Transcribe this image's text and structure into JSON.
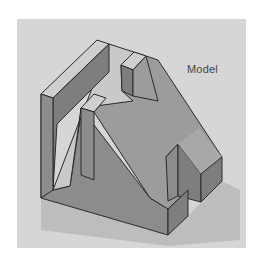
{
  "figure": {
    "label": "Model",
    "colors": {
      "background": "#ffffff",
      "panel": "#d6d6d6",
      "top_face": "#c4c4c4",
      "slope_face": "#9c9c9c",
      "front_face": "#8c8c8c",
      "side_face": "#7e7e7e",
      "shadow": "#bdbdbd",
      "edge": "#2a2a2a"
    }
  }
}
